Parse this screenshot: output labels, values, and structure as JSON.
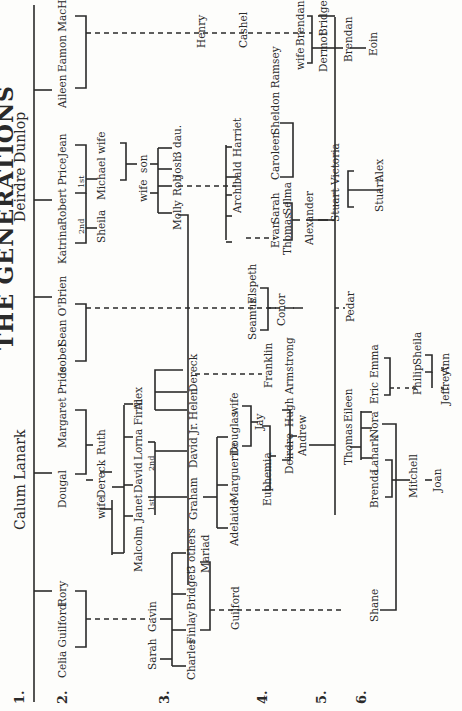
{
  "title": "THE GENERATIONS",
  "generation_labels": [
    "1.",
    "2.",
    "3.",
    "4.",
    "5.",
    "6."
  ],
  "founders": {
    "left": "Calum Lanark",
    "right": "Deirdre Dunlop"
  },
  "gen2": {
    "celia": "Celia Guilford",
    "rory": "Rory",
    "dougal": "Dougal",
    "margaret": "Margaret Price",
    "isobel": "Isobel",
    "sean": "Sean O'Brien",
    "katrina": "Katrina",
    "robert": "Robert Price",
    "jean": "Jean",
    "aileen": "Aileen",
    "eamon": "Eamon MacHenry",
    "second": "2nd",
    "first": "1st"
  },
  "gen3": {
    "sarah": "Sarah",
    "gavin": "Gavin",
    "wife_dereck": "wife",
    "dereck": "Dereck",
    "ruth": "Ruth",
    "sheila": "Sheila",
    "michael": "Michael",
    "wife_michael": "wife",
    "henry": "Henry"
  },
  "gen3b": {
    "charles": "Charles",
    "finlay": "Finlay",
    "bridget": "Bridget",
    "others": "3 others",
    "mariad": "Mariad",
    "malcolm": "Malcolm",
    "janet": "Janet",
    "david": "David",
    "lorna": "Lorna Firth",
    "alex": "Alex",
    "first": "1st",
    "second": "2nd",
    "wife_son": "wife",
    "son": "son",
    "cashel": "Cashel",
    "wife_brendan": "wife",
    "brendan": "Brendan",
    "dermot": "Dermot",
    "bridget2": "Bridget"
  },
  "gen4": {
    "guilford": "Guilford",
    "graham": "Graham",
    "david_jr": "David Jr.",
    "helen": "Helen",
    "dereck2": "Dereck",
    "molly": "Molly",
    "rob": "Rob",
    "josh": "Josh",
    "dau": "3 dau.",
    "brendan2": "Brendan",
    "eoin": "Eoin"
  },
  "gen4b": {
    "adelaide": "Adelaide",
    "marguerite": "Marguerite",
    "douglas": "Douglas",
    "wife_douglas": "wife",
    "franklin": "Franklin",
    "seamus": "Seamus",
    "elspeth": "Elspeth",
    "archibald": "Archibald",
    "harriet": "Harriet",
    "caroleen": "Caroleen",
    "sheldon": "Sheldon Ramsey",
    "evan": "Evan",
    "sarah2": "Sarah"
  },
  "gen5": {
    "euphemia": "Euphemia",
    "jay": "Jay",
    "deirdre": "Deirdre",
    "hugh": "Hugh Armstrong",
    "conor": "Conor",
    "thomas": "Thomas",
    "selma": "Selma",
    "stuart": "Stuart",
    "victoria": "Victoria",
    "andrew": "Andrew",
    "alexander": "Alexander",
    "pedar": "Pedar"
  },
  "gen6": {
    "shane": "Shane",
    "brenda": "Brenda",
    "lanark": "Lanark",
    "thomas2": "Thomas",
    "eileen": "Eileen",
    "nora": "Nora",
    "eric": "Eric",
    "emma": "Emma",
    "philip": "Philip",
    "sheila2": "Sheila",
    "jeffrey": "Jeffrey",
    "ann": "Ann",
    "mitchell": "Mitchell",
    "joan": "Joan",
    "stuart2": "Stuart",
    "alex2": "Alex"
  },
  "colors": {
    "ink": "#2a2a2a",
    "paper": "#fdfdfb"
  }
}
